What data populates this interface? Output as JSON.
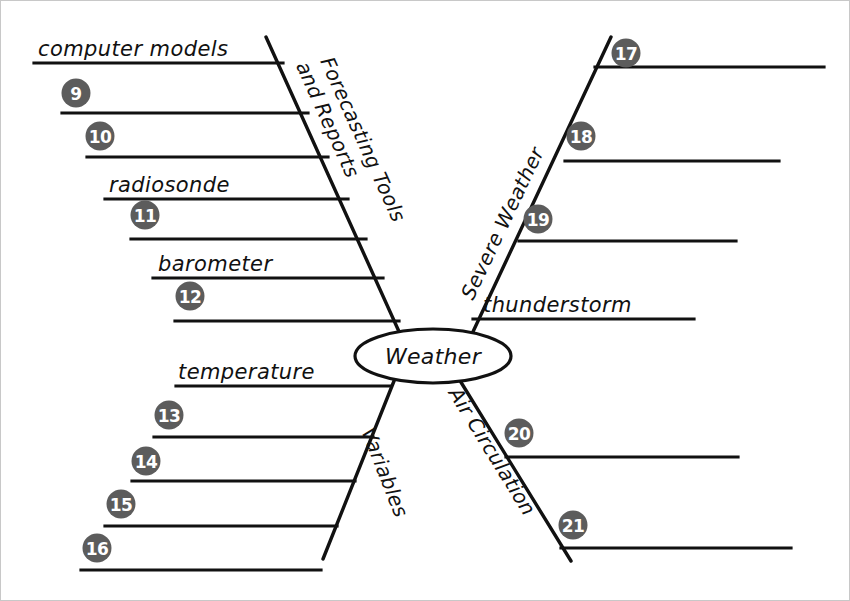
{
  "diagram": {
    "center_label": "Weather",
    "line_color": "#111111",
    "circle_color": "#5c5c5c",
    "circle_text_color": "#ffffff",
    "background_color": "#ffffff",
    "branches": [
      {
        "id": "forecasting-tools-and-reports",
        "label_line1": "Forecasting Tools",
        "label_line2": "and Reports",
        "position": "upper-left",
        "items": [
          {
            "kind": "label",
            "text": "computer models"
          },
          {
            "kind": "number",
            "text": "9"
          },
          {
            "kind": "number",
            "text": "10"
          },
          {
            "kind": "label",
            "text": "radiosonde"
          },
          {
            "kind": "number",
            "text": "11"
          },
          {
            "kind": "label",
            "text": "barometer"
          },
          {
            "kind": "number",
            "text": "12"
          }
        ]
      },
      {
        "id": "severe-weather",
        "label_line1": "Severe Weather",
        "label_line2": "",
        "position": "upper-right",
        "items": [
          {
            "kind": "number",
            "text": "17"
          },
          {
            "kind": "number",
            "text": "18"
          },
          {
            "kind": "number",
            "text": "19"
          },
          {
            "kind": "label",
            "text": "thunderstorm"
          }
        ]
      },
      {
        "id": "variables",
        "label_line1": "Variables",
        "label_line2": "",
        "position": "lower-left",
        "items": [
          {
            "kind": "label",
            "text": "temperature"
          },
          {
            "kind": "number",
            "text": "13"
          },
          {
            "kind": "number",
            "text": "14"
          },
          {
            "kind": "number",
            "text": "15"
          },
          {
            "kind": "number",
            "text": "16"
          }
        ]
      },
      {
        "id": "air-circulation",
        "label_line1": "Air Circulation",
        "label_line2": "",
        "position": "lower-right",
        "items": [
          {
            "kind": "number",
            "text": "20"
          },
          {
            "kind": "number",
            "text": "21"
          }
        ]
      }
    ],
    "labels": {
      "computer_models": "computer models",
      "radiosonde": "radiosonde",
      "barometer": "barometer",
      "temperature": "temperature",
      "thunderstorm": "thunderstorm",
      "forecasting_tools": "Forecasting Tools",
      "and_reports": "and Reports",
      "severe_weather": "Severe Weather",
      "variables": "Variables",
      "air_circulation": "Air Circulation",
      "weather": "Weather"
    },
    "numbers": {
      "n9": "9",
      "n10": "10",
      "n11": "11",
      "n12": "12",
      "n13": "13",
      "n14": "14",
      "n15": "15",
      "n16": "16",
      "n17": "17",
      "n18": "18",
      "n19": "19",
      "n20": "20",
      "n21": "21"
    }
  }
}
